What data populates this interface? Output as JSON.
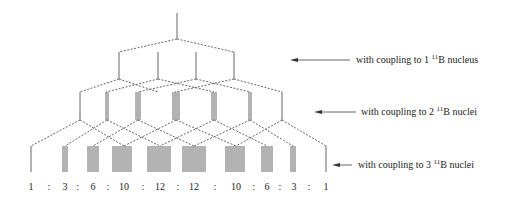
{
  "diagram": {
    "labels": [
      {
        "prefix": "with coupling to 1 ",
        "isotope_mass": "11",
        "isotope_symbol": "B",
        "suffix": " nucleus"
      },
      {
        "prefix": "with coupling to 2 ",
        "isotope_mass": "11",
        "isotope_symbol": "B",
        "suffix": " nuclei"
      },
      {
        "prefix": "with coupling to 3 ",
        "isotope_mass": "11",
        "isotope_symbol": "B",
        "suffix": " nuclei"
      }
    ],
    "ratios": [
      "1",
      "3",
      "6",
      "10",
      "12",
      "12",
      "10",
      "6",
      "3",
      "1"
    ],
    "separator": ":",
    "line_color": "#555555"
  }
}
